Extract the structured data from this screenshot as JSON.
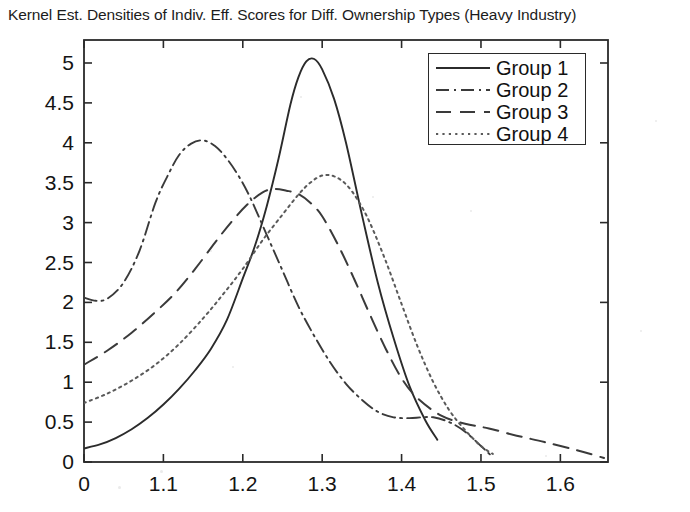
{
  "chart_data": {
    "type": "line",
    "title": "Kernel Est. Densities of Indiv. Eff. Scores for Diff. Ownership Types (Heavy Industry)",
    "xlabel": "",
    "ylabel": "",
    "xlim": [
      1.0,
      1.66
    ],
    "ylim": [
      0,
      5.25
    ],
    "grid": false,
    "legend_position": "top-right",
    "xticks": [
      1.0,
      1.1,
      1.2,
      1.3,
      1.4,
      1.5,
      1.6
    ],
    "xtick_labels": [
      "0",
      "1.1",
      "1.2",
      "1.3",
      "1.4",
      "1.5",
      "1.6"
    ],
    "yticks": [
      0,
      0.5,
      1,
      1.5,
      2,
      2.5,
      3,
      3.5,
      4,
      4.5,
      5
    ],
    "ytick_labels": [
      "0",
      "0.5",
      "1",
      "1.5",
      "2",
      "2.5",
      "3",
      "3.5",
      "4",
      "4.5",
      "5"
    ],
    "series": [
      {
        "name": "Group 1",
        "linestyle": "solid",
        "color": "#2b2b2b",
        "peak_x": 1.28,
        "peak_y": 5.05,
        "x": [
          1.0,
          1.02,
          1.04,
          1.06,
          1.08,
          1.1,
          1.12,
          1.14,
          1.16,
          1.18,
          1.2,
          1.215,
          1.23,
          1.245,
          1.26,
          1.27,
          1.28,
          1.29,
          1.3,
          1.315,
          1.33,
          1.35,
          1.37,
          1.39,
          1.41,
          1.43,
          1.445
        ],
        "y": [
          0.17,
          0.22,
          0.3,
          0.41,
          0.55,
          0.72,
          0.92,
          1.15,
          1.42,
          1.78,
          2.3,
          2.7,
          3.2,
          3.8,
          4.48,
          4.82,
          5.02,
          5.05,
          4.92,
          4.55,
          4.0,
          3.1,
          2.25,
          1.55,
          0.95,
          0.52,
          0.28
        ]
      },
      {
        "name": "Group 2",
        "linestyle": "dashdot",
        "color": "#3a3a3a",
        "peak_x": 1.15,
        "peak_y": 4.03,
        "x": [
          1.0,
          1.015,
          1.03,
          1.05,
          1.07,
          1.09,
          1.105,
          1.12,
          1.135,
          1.15,
          1.165,
          1.18,
          1.195,
          1.21,
          1.23,
          1.25,
          1.27,
          1.29,
          1.31,
          1.33,
          1.35,
          1.37,
          1.39,
          1.41,
          1.425,
          1.44,
          1.46,
          1.48,
          1.5,
          1.515
        ],
        "y": [
          2.06,
          2.02,
          2.05,
          2.25,
          2.65,
          3.25,
          3.58,
          3.85,
          3.99,
          4.03,
          3.96,
          3.8,
          3.58,
          3.3,
          2.85,
          2.4,
          1.95,
          1.58,
          1.25,
          0.98,
          0.78,
          0.63,
          0.56,
          0.55,
          0.56,
          0.56,
          0.5,
          0.38,
          0.2,
          0.06
        ]
      },
      {
        "name": "Group 3",
        "linestyle": "dashed",
        "color": "#3a3a3a",
        "peak_x": 1.25,
        "peak_y": 3.42,
        "x": [
          1.0,
          1.03,
          1.06,
          1.09,
          1.115,
          1.14,
          1.165,
          1.185,
          1.205,
          1.225,
          1.24,
          1.255,
          1.27,
          1.285,
          1.3,
          1.32,
          1.34,
          1.36,
          1.38,
          1.4,
          1.42,
          1.45,
          1.48,
          1.51,
          1.545,
          1.58,
          1.62,
          1.655
        ],
        "y": [
          1.22,
          1.4,
          1.62,
          1.88,
          2.12,
          2.42,
          2.75,
          3.0,
          3.22,
          3.38,
          3.42,
          3.4,
          3.36,
          3.25,
          3.08,
          2.72,
          2.3,
          1.85,
          1.42,
          1.05,
          0.8,
          0.58,
          0.48,
          0.42,
          0.33,
          0.25,
          0.15,
          0.05
        ]
      },
      {
        "name": "Group 4",
        "linestyle": "dotted",
        "color": "#5a5a5a",
        "peak_x": 1.3,
        "peak_y": 3.6,
        "x": [
          1.0,
          1.03,
          1.06,
          1.09,
          1.12,
          1.15,
          1.175,
          1.2,
          1.225,
          1.25,
          1.27,
          1.285,
          1.3,
          1.315,
          1.33,
          1.345,
          1.36,
          1.38,
          1.4,
          1.42,
          1.44,
          1.46,
          1.48,
          1.5,
          1.515
        ],
        "y": [
          0.74,
          0.86,
          1.02,
          1.22,
          1.48,
          1.8,
          2.1,
          2.42,
          2.78,
          3.1,
          3.35,
          3.5,
          3.59,
          3.58,
          3.48,
          3.28,
          3.0,
          2.52,
          1.98,
          1.45,
          1.0,
          0.65,
          0.4,
          0.2,
          0.1
        ]
      }
    ]
  },
  "legend": {
    "items": [
      {
        "label": "Group 1",
        "style": "solid"
      },
      {
        "label": "Group 2",
        "style": "dashdot"
      },
      {
        "label": "Group 3",
        "style": "dashed"
      },
      {
        "label": "Group 4",
        "style": "dotted"
      }
    ]
  },
  "axes": {
    "frame_color": "#2a2a2a"
  }
}
